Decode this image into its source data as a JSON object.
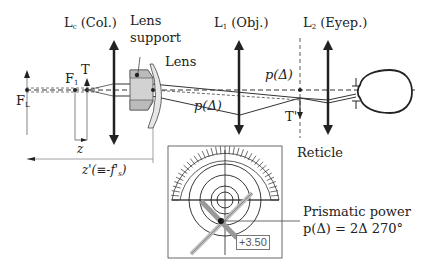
{
  "diagram": {
    "type": "optical-schematic",
    "lenses": {
      "collimator": {
        "symbol": "L",
        "subscript": "c",
        "name": "(Col.)"
      },
      "objective": {
        "symbol": "L",
        "subscript": "1",
        "name": "(Obj.)"
      },
      "eyepiece": {
        "symbol": "L",
        "subscript": "2",
        "name": "(Eyep.)"
      }
    },
    "labels": {
      "lens_support": [
        "Lens",
        "support"
      ],
      "lens": "Lens",
      "reticle": "Reticle",
      "focal_point_L": {
        "symbol": "F",
        "subscript": "L"
      },
      "focal_point_1": {
        "symbol": "F",
        "subscript": "1"
      },
      "target": "T",
      "target_image": "T'",
      "prism_upper": "p(Δ)",
      "prism_lower": "p(Δ)",
      "z": "z",
      "z_prime": {
        "text": "z'(≡-f'",
        "subscript": "s",
        "close": ")"
      }
    },
    "reticle_view": {
      "reading": "+3.50",
      "callout_title": "Prismatic power",
      "callout_value": "p(Δ) = 2Δ 270°",
      "rings": 4
    },
    "colors": {
      "line": "#222222",
      "lens_fill": "#e6e6e6",
      "support_fill": "#c8c8c8",
      "target_mark": "#999999",
      "dim_line": "#888888"
    }
  }
}
